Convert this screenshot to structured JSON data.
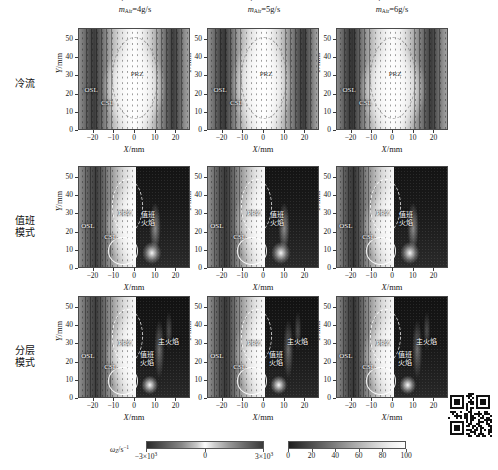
{
  "figure": {
    "columns": [
      {
        "id": "col-4gs",
        "prefix": "m",
        "sub": "Air",
        "eq": "=4g/s"
      },
      {
        "id": "col-5gs",
        "prefix": "m",
        "sub": "Air",
        "eq": "=5g/s"
      },
      {
        "id": "col-6gs",
        "prefix": "m",
        "sub": "Air",
        "eq": "=6g/s"
      }
    ],
    "rows": [
      {
        "id": "row-cold",
        "label": "冷流"
      },
      {
        "id": "row-pilot",
        "label": "值班\n模式",
        "line1": "值班",
        "line2": "模式"
      },
      {
        "id": "row-strat",
        "label": "分层\n模式",
        "line1": "分层",
        "line2": "模式"
      }
    ],
    "axes": {
      "x_title_var": "X",
      "x_title_unit": "/mm",
      "y_title_var": "Y",
      "y_title_unit": "/mm",
      "x_ticks": [
        "−20",
        "−10",
        "0",
        "10",
        "20"
      ],
      "y_ticks": [
        "0",
        "10",
        "20",
        "30",
        "40",
        "50"
      ],
      "x_range": [
        -27,
        27
      ],
      "y_range": [
        0,
        56
      ]
    },
    "annotations": {
      "prz": "PRZ",
      "osl": "OSL",
      "csl": "CSL",
      "pilot_flame_l1": "值班",
      "pilot_flame_l2": "火焰",
      "main_flame": "主火焰"
    },
    "colorbars": [
      {
        "id": "vorticity",
        "title_var": "ω",
        "title_sub": "Z",
        "title_unit": "/s",
        "title_sup": "−1",
        "ticks": [
          "−3×10",
          "0",
          "3×10"
        ],
        "tick_exp": "3",
        "min_label": "−3×10³",
        "max_label": "3×10³"
      },
      {
        "id": "intensity",
        "ticks": [
          "0",
          "20",
          "40",
          "60",
          "80",
          "100"
        ]
      }
    ]
  },
  "chart_data": {
    "type": "heatmap",
    "title": "",
    "layout": {
      "rows": 3,
      "cols": 3,
      "grid": false,
      "legend": "bottom"
    },
    "col_categories": [
      "ṁ_Air=4g/s",
      "ṁ_Air=5g/s",
      "ṁ_Air=6g/s"
    ],
    "row_categories": [
      "冷流",
      "值班模式",
      "分层模式"
    ],
    "xlabel": "X/mm",
    "ylabel": "Y/mm",
    "xlim": [
      -27,
      27
    ],
    "ylim": [
      0,
      56
    ],
    "xticks": [
      -20,
      -10,
      0,
      10,
      20
    ],
    "yticks": [
      0,
      10,
      20,
      30,
      40,
      50
    ],
    "colorbars": [
      {
        "label": "ω_Z/s⁻¹",
        "min": -3000,
        "max": 3000,
        "ticks": [
          -3000,
          0,
          3000
        ],
        "cmap": "gray-diverging"
      },
      {
        "label": "",
        "min": 0,
        "max": 100,
        "ticks": [
          0,
          20,
          40,
          60,
          80,
          100
        ],
        "cmap": "gray"
      }
    ],
    "annotated_features": [
      "PRZ",
      "OSL",
      "CSL",
      "值班火焰",
      "主火焰"
    ]
  }
}
